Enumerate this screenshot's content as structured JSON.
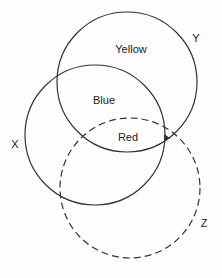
{
  "diagram": {
    "type": "venn",
    "circles": [
      {
        "id": "Y",
        "label": "Y",
        "cx": 127,
        "cy": 82,
        "r": 70,
        "style": "solid"
      },
      {
        "id": "X",
        "label": "X",
        "cx": 95,
        "cy": 135,
        "r": 70,
        "style": "solid"
      },
      {
        "id": "Z",
        "label": "Z",
        "cx": 130,
        "cy": 188,
        "r": 70,
        "style": "dashed"
      }
    ],
    "region_labels": {
      "yellow": "Yellow",
      "blue": "Blue",
      "red": "Red"
    },
    "circle_labels": {
      "y": "Y",
      "x": "X",
      "z": "Z"
    },
    "colors": {
      "stroke": "#333333",
      "background": "#fdfdfd"
    }
  }
}
